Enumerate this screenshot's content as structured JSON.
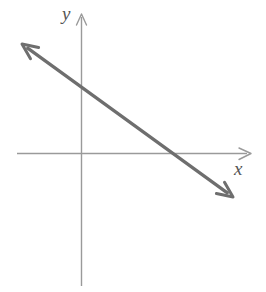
{
  "figure": {
    "kind": "cartesian-coordinate-plane-with-line",
    "width": 266,
    "height": 292,
    "background_color": "#ffffff"
  },
  "axes": {
    "x_label": "x",
    "y_label": "y",
    "axis_color": "#9a9a9a",
    "axis_stroke_width": 1.4,
    "origin": {
      "x": 81,
      "y": 153
    },
    "x_axis": {
      "x_start": 17,
      "x_end": 250,
      "y": 153,
      "arrow": "right"
    },
    "y_axis": {
      "y_start": 14,
      "y_end": 286,
      "x": 81,
      "arrow": "up"
    }
  },
  "chart_data": {
    "type": "line",
    "title": "",
    "xlabel": "x",
    "ylabel": "y",
    "grid": false,
    "legend": null,
    "annotations": [],
    "series": [
      {
        "name": "line",
        "color": "#6e6e6e",
        "stroke_width": 3.2,
        "arrows": "both",
        "endpoints_px": [
          {
            "x": 22,
            "y": 44
          },
          {
            "x": 233,
            "y": 197
          }
        ],
        "y_intercept_px": {
          "x": 81,
          "y": 87
        },
        "x_intercept_px": {
          "x": 173,
          "y": 153
        },
        "slope_sign": "negative",
        "description": "Double-headed straight line falling from upper left to lower right, crossing the y-axis above the origin and the x-axis to the right of the origin."
      }
    ]
  }
}
